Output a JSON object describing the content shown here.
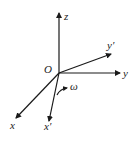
{
  "diagram": {
    "type": "coordinate-frame-rotation",
    "origin_label": "O",
    "axes": [
      {
        "id": "z",
        "label": "z",
        "x1": 59,
        "y1": 73,
        "x2": 59,
        "y2": 13,
        "lx": 64,
        "ly": 20
      },
      {
        "id": "y",
        "label": "y",
        "x1": 59,
        "y1": 73,
        "x2": 120,
        "y2": 73,
        "lx": 123,
        "ly": 77
      },
      {
        "id": "y-prime",
        "label": "y′",
        "x1": 59,
        "y1": 73,
        "x2": 111,
        "y2": 54,
        "lx": 107,
        "ly": 49
      },
      {
        "id": "x",
        "label": "x",
        "x1": 59,
        "y1": 73,
        "x2": 16,
        "y2": 118,
        "lx": 10,
        "ly": 129
      },
      {
        "id": "x-prime",
        "label": "x′",
        "x1": 59,
        "y1": 73,
        "x2": 49,
        "y2": 121,
        "lx": 44,
        "ly": 130
      }
    ],
    "rotation": {
      "label": "ω"
    },
    "colors": {
      "stroke": "#1a1a1a",
      "text": "#222222",
      "background": "#ffffff"
    }
  }
}
